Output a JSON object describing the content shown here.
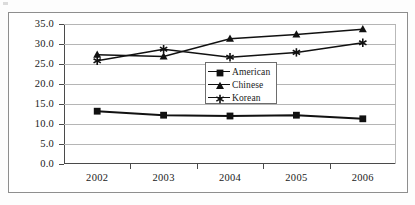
{
  "chart_data": {
    "type": "line",
    "title": "",
    "xlabel": "",
    "ylabel": "",
    "categories": [
      "2002",
      "2003",
      "2004",
      "2005",
      "2006"
    ],
    "ylim": [
      0.0,
      35.0
    ],
    "yticks": [
      "0.0",
      "5.0",
      "10.0",
      "15.0",
      "20.0",
      "25.0",
      "30.0",
      "35.0"
    ],
    "ytick_values": [
      0.0,
      5.0,
      10.0,
      15.0,
      20.0,
      25.0,
      30.0,
      35.0
    ],
    "grid": "horizontal",
    "legend_position": "center-left-inside",
    "series": [
      {
        "name": "American",
        "marker": "filled-square",
        "color": "#111111",
        "values": [
          13.2,
          12.2,
          12.0,
          12.2,
          11.3
        ]
      },
      {
        "name": "Chinese",
        "marker": "filled-triangle",
        "color": "#111111",
        "values": [
          27.3,
          26.9,
          31.3,
          32.4,
          33.7
        ]
      },
      {
        "name": "Korean",
        "marker": "asterisk",
        "color": "#111111",
        "values": [
          25.8,
          28.7,
          26.7,
          27.9,
          30.3
        ]
      }
    ]
  },
  "legend": {
    "entries": [
      {
        "label": "American",
        "marker": "filled-square"
      },
      {
        "label": "Chinese",
        "marker": "filled-triangle"
      },
      {
        "label": "Korean",
        "marker": "asterisk"
      }
    ]
  }
}
